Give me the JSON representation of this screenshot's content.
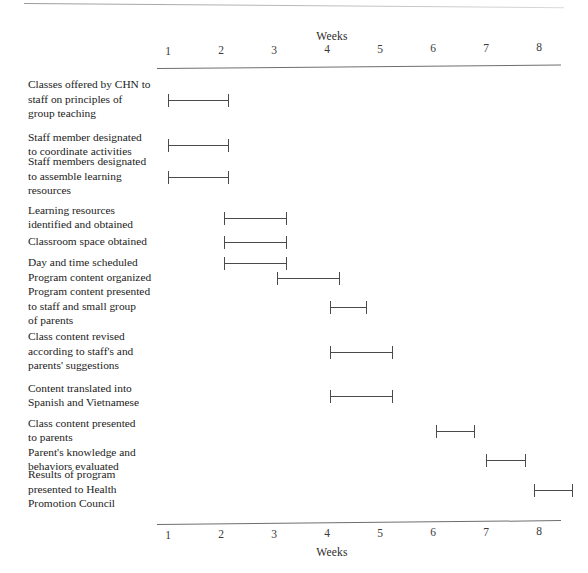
{
  "chart_data": {
    "type": "bar",
    "title": "",
    "xlabel": "Weeks",
    "ylabel": "",
    "axis_title_top": "Weeks",
    "axis_title_bottom": "Weeks",
    "xlim": [
      1,
      8.7
    ],
    "grid": false,
    "legend": "none",
    "orientation": "horizontal",
    "tick_labels": [
      "1",
      "2",
      "3",
      "4",
      "5",
      "6",
      "7",
      "8"
    ],
    "tick_values": [
      1,
      2,
      3,
      4,
      5,
      6,
      7,
      8
    ],
    "categories": [
      "Classes offered by CHN to staff on principles of group teaching",
      "Staff member designated to coordinate activities",
      "Staff members designated to assemble learning resources",
      "Learning resources identified and obtained",
      "Classroom space obtained",
      "Day and time scheduled",
      "Program content organized",
      "Program content presented to staff and small group of parents",
      "Class content revised according to staff's and parents' suggestions",
      "Content translated into Spanish and Vietnamese",
      "Class content presented to parents",
      "Parent's knowledge and behaviors evaluated",
      "Results of program presented to Health Promotion Council"
    ],
    "tasks": [
      {
        "label": "Classes offered by CHN to staff on principles of group teaching",
        "lines": [
          "Classes offered by CHN to",
          "staff on principles of",
          "group teaching"
        ],
        "start_week": 1.0,
        "end_week": 2.15
      },
      {
        "label": "Staff member designated to coordinate activities",
        "lines": [
          "Staff member designated",
          "to coordinate activities"
        ],
        "start_week": 1.0,
        "end_week": 2.15
      },
      {
        "label": "Staff members designated to assemble learning resources",
        "lines": [
          "Staff members designated",
          "to assemble learning",
          "resources"
        ],
        "start_week": 1.0,
        "end_week": 2.15
      },
      {
        "label": "Learning resources identified and obtained",
        "lines": [
          "Learning resources",
          "identified and obtained"
        ],
        "start_week": 2.05,
        "end_week": 3.25
      },
      {
        "label": "Classroom space obtained",
        "lines": [
          "Classroom space obtained"
        ],
        "start_week": 2.05,
        "end_week": 3.25
      },
      {
        "label": "Day and time scheduled",
        "lines": [
          "Day and time scheduled"
        ],
        "start_week": 2.05,
        "end_week": 3.25
      },
      {
        "label": "Program content organized",
        "lines": [
          "Program content organized"
        ],
        "start_week": 3.05,
        "end_week": 4.25
      },
      {
        "label": "Program content presented to staff and small group of parents",
        "lines": [
          "Program content presented",
          "to staff and small group",
          "of parents"
        ],
        "start_week": 4.05,
        "end_week": 4.75
      },
      {
        "label": "Class content revised according to staff's and parents' suggestions",
        "lines": [
          "Class content revised",
          "according to staff's and",
          "parents' suggestions"
        ],
        "start_week": 4.05,
        "end_week": 5.25
      },
      {
        "label": "Content translated into Spanish and Vietnamese",
        "lines": [
          "Content translated into",
          "Spanish and Vietnamese"
        ],
        "start_week": 4.05,
        "end_week": 5.25
      },
      {
        "label": "Class content presented to parents",
        "lines": [
          "Class content presented",
          "to parents"
        ],
        "start_week": 6.05,
        "end_week": 6.8
      },
      {
        "label": "Parent's knowledge and behaviors evaluated",
        "lines": [
          "Parent's knowledge and",
          "behaviors evaluated"
        ],
        "start_week": 7.0,
        "end_week": 7.75
      },
      {
        "label": "Results of program presented to Health Promotion Council",
        "lines": [
          "Results of program",
          "presented to Health",
          "Promotion Council"
        ],
        "start_week": 7.9,
        "end_week": 8.65
      }
    ],
    "colors": {
      "bar": "#4a4a4a",
      "axis": "#6e6e6e",
      "text": "#1c1c1c",
      "background": "#ffffff"
    }
  }
}
